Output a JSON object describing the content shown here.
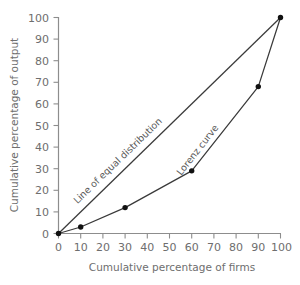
{
  "chart_data": {
    "type": "line",
    "title": "",
    "xlabel": "Cumulative percentage of firms",
    "ylabel": "Cumulative percentage of output",
    "xlim": [
      0,
      100
    ],
    "ylim": [
      0,
      100
    ],
    "grid": false,
    "legend_position": "inline-annotations",
    "xticks": [
      "0",
      "10",
      "20",
      "30",
      "40",
      "50",
      "60",
      "70",
      "80",
      "90",
      "100"
    ],
    "yticks": [
      "0",
      "10",
      "20",
      "30",
      "40",
      "50",
      "60",
      "70",
      "80",
      "90",
      "100"
    ],
    "xtick_values": [
      0,
      10,
      20,
      30,
      40,
      50,
      60,
      70,
      80,
      90,
      100
    ],
    "ytick_values": [
      0,
      10,
      20,
      30,
      40,
      50,
      60,
      70,
      80,
      90,
      100
    ],
    "series": [
      {
        "name": "Line of equal distribution",
        "x": [
          0,
          100
        ],
        "values": [
          0,
          100
        ],
        "markers": false,
        "annotation": "Line of equal distribution"
      },
      {
        "name": "Lorenz curve",
        "x": [
          0,
          10,
          30,
          60,
          90,
          100
        ],
        "values": [
          0,
          3,
          12,
          29,
          68,
          100
        ],
        "markers": true,
        "annotation": "Lorenz curve"
      }
    ],
    "annotations": [
      {
        "text": "Line of equal distribution",
        "x": 36,
        "y": 40,
        "rotation": -44
      },
      {
        "text": "Lorenz curve",
        "x": 66,
        "y": 45,
        "rotation": -52
      }
    ]
  },
  "colors": {
    "background": "#ffffff",
    "axis": "#8d8d8d",
    "tick_text": "#6e6e6e",
    "line": "#3a3a3a",
    "point": "#111111",
    "annotation_text": "#5a5a5a"
  }
}
